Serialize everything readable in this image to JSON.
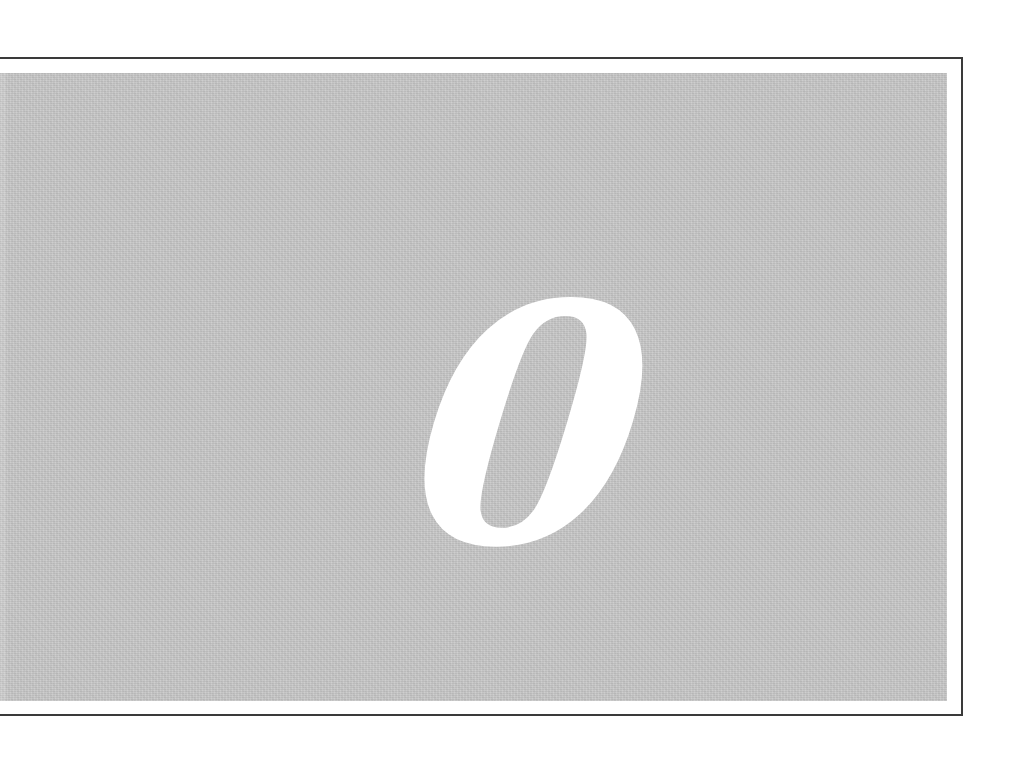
{
  "figure": {
    "numeral": "0",
    "panel_color": "#c9c9c9",
    "numeral_color": "#ffffff",
    "border_color": "#3a3a3a"
  }
}
